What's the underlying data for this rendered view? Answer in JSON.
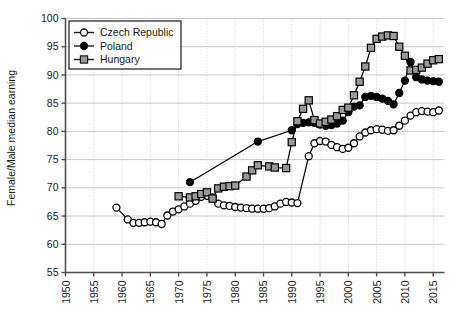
{
  "chart_data": {
    "type": "line",
    "title": "",
    "xlabel": "",
    "ylabel": "Female/Male median earning",
    "xlim": [
      1950,
      2017
    ],
    "ylim": [
      55,
      100
    ],
    "xticks": [
      1950,
      1955,
      1960,
      1965,
      1970,
      1975,
      1980,
      1985,
      1990,
      1995,
      2000,
      2005,
      2010,
      2015
    ],
    "yticks": [
      55,
      60,
      65,
      70,
      75,
      80,
      85,
      90,
      95,
      100
    ],
    "grid": "both",
    "legend_position": "top-left",
    "series": [
      {
        "name": "Czech Republic",
        "marker": "open-circle",
        "color": "#000000",
        "fill": "#ffffff",
        "points": [
          [
            1959,
            66.5
          ],
          [
            1961,
            64.4
          ],
          [
            1962,
            63.8
          ],
          [
            1963,
            63.8
          ],
          [
            1964,
            63.9
          ],
          [
            1965,
            64.0
          ],
          [
            1966,
            63.9
          ],
          [
            1967,
            63.6
          ],
          [
            1968,
            65.1
          ],
          [
            1969,
            65.8
          ],
          [
            1970,
            66.2
          ],
          [
            1971,
            66.7
          ],
          [
            1972,
            67.2
          ],
          [
            1973,
            67.7
          ],
          [
            1974,
            68.4
          ],
          [
            1975,
            68.6
          ],
          [
            1976,
            68.3
          ],
          [
            1977,
            67.2
          ],
          [
            1978,
            66.9
          ],
          [
            1979,
            66.8
          ],
          [
            1980,
            66.6
          ],
          [
            1981,
            66.5
          ],
          [
            1982,
            66.4
          ],
          [
            1983,
            66.3
          ],
          [
            1984,
            66.3
          ],
          [
            1985,
            66.3
          ],
          [
            1986,
            66.4
          ],
          [
            1987,
            66.7
          ],
          [
            1988,
            67.2
          ],
          [
            1989,
            67.5
          ],
          [
            1990,
            67.4
          ],
          [
            1991,
            67.3
          ],
          [
            1993,
            75.6
          ],
          [
            1994,
            77.9
          ],
          [
            1995,
            78.3
          ],
          [
            1996,
            78.2
          ],
          [
            1997,
            77.6
          ],
          [
            1998,
            77.2
          ],
          [
            1999,
            76.9
          ],
          [
            2000,
            77.1
          ],
          [
            2001,
            77.9
          ],
          [
            2002,
            79.1
          ],
          [
            2003,
            79.8
          ],
          [
            2004,
            80.2
          ],
          [
            2005,
            80.4
          ],
          [
            2006,
            80.3
          ],
          [
            2007,
            80.1
          ],
          [
            2008,
            80.2
          ],
          [
            2009,
            81.0
          ],
          [
            2010,
            81.9
          ],
          [
            2011,
            82.8
          ],
          [
            2012,
            83.4
          ],
          [
            2013,
            83.6
          ],
          [
            2014,
            83.5
          ],
          [
            2015,
            83.4
          ],
          [
            2016,
            83.7
          ]
        ]
      },
      {
        "name": "Poland",
        "marker": "filled-circle",
        "color": "#000000",
        "fill": "#000000",
        "points": [
          [
            1972,
            71.0
          ],
          [
            1984,
            78.2
          ],
          [
            1990,
            80.2
          ],
          [
            1991,
            81.3
          ],
          [
            1992,
            81.5
          ],
          [
            1993,
            81.6
          ],
          [
            1994,
            81.5
          ],
          [
            1995,
            81.2
          ],
          [
            1996,
            81.0
          ],
          [
            1997,
            81.1
          ],
          [
            1998,
            81.4
          ],
          [
            1999,
            81.9
          ],
          [
            2000,
            83.4
          ],
          [
            2001,
            84.4
          ],
          [
            2002,
            84.6
          ],
          [
            2003,
            86.1
          ],
          [
            2004,
            86.3
          ],
          [
            2005,
            86.1
          ],
          [
            2006,
            85.8
          ],
          [
            2007,
            85.4
          ],
          [
            2008,
            84.8
          ],
          [
            2009,
            86.8
          ],
          [
            2010,
            89.0
          ],
          [
            2011,
            92.3
          ],
          [
            2012,
            89.6
          ],
          [
            2013,
            89.2
          ],
          [
            2014,
            89.0
          ],
          [
            2015,
            88.9
          ],
          [
            2016,
            88.8
          ]
        ]
      },
      {
        "name": "Hungary",
        "marker": "filled-square",
        "color": "#000000",
        "fill": "#9a9a9a",
        "points": [
          [
            1970,
            68.5
          ],
          [
            1972,
            68.3
          ],
          [
            1973,
            68.5
          ],
          [
            1974,
            68.9
          ],
          [
            1975,
            69.2
          ],
          [
            1976,
            68.1
          ],
          [
            1977,
            69.9
          ],
          [
            1978,
            70.2
          ],
          [
            1979,
            70.3
          ],
          [
            1980,
            70.4
          ],
          [
            1982,
            72.0
          ],
          [
            1983,
            73.1
          ],
          [
            1984,
            74.0
          ],
          [
            1986,
            73.8
          ],
          [
            1987,
            73.6
          ],
          [
            1989,
            73.5
          ],
          [
            1990,
            78.1
          ],
          [
            1991,
            81.8
          ],
          [
            1992,
            84.0
          ],
          [
            1993,
            85.5
          ],
          [
            1994,
            82.0
          ],
          [
            1995,
            81.4
          ],
          [
            1996,
            81.7
          ],
          [
            1997,
            82.1
          ],
          [
            1998,
            82.7
          ],
          [
            1999,
            83.8
          ],
          [
            2000,
            84.2
          ],
          [
            2001,
            86.4
          ],
          [
            2002,
            88.8
          ],
          [
            2003,
            91.5
          ],
          [
            2004,
            94.8
          ],
          [
            2005,
            96.4
          ],
          [
            2006,
            96.8
          ],
          [
            2007,
            97.0
          ],
          [
            2008,
            96.9
          ],
          [
            2009,
            95.0
          ],
          [
            2010,
            93.4
          ],
          [
            2011,
            90.8
          ],
          [
            2012,
            90.9
          ],
          [
            2013,
            91.3
          ],
          [
            2014,
            92.0
          ],
          [
            2015,
            92.6
          ],
          [
            2016,
            92.8
          ]
        ]
      }
    ]
  },
  "legend": {
    "items": [
      {
        "label": "Czech Republic",
        "marker": "open-circle"
      },
      {
        "label": "Poland",
        "marker": "filled-circle"
      },
      {
        "label": "Hungary",
        "marker": "filled-square"
      }
    ]
  },
  "colors": {
    "axis": "#4d4d4d",
    "grid_horizontal": "#c8c8c8",
    "grid_vertical": "#c8c8c8",
    "marker_line": "#1a1a1a",
    "hungary_fill": "#9a9a9a",
    "text": "#1a1a1a"
  }
}
